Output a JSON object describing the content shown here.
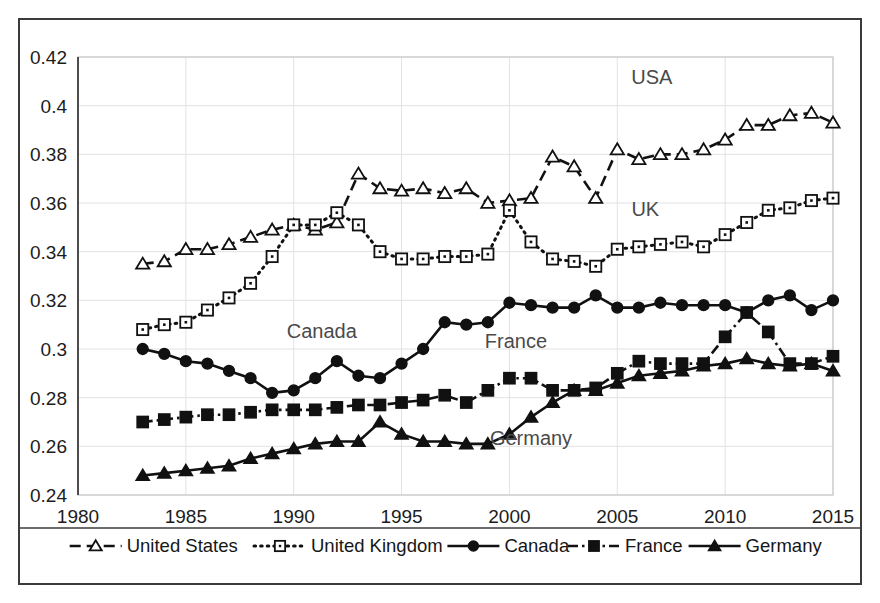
{
  "chart_data": {
    "type": "line",
    "title": "",
    "subtitle": "",
    "xlabel": "",
    "ylabel": "",
    "xlim": [
      1980,
      2015
    ],
    "ylim": [
      0.24,
      0.42
    ],
    "xticks": [
      1980,
      1985,
      1990,
      1995,
      2000,
      2005,
      2010,
      2015
    ],
    "xtick_labels": [
      "1980",
      "1985",
      "1990",
      "1995",
      "2000",
      "2005",
      "2010",
      "2015"
    ],
    "yticks": [
      0.24,
      0.26,
      0.28,
      0.3,
      0.32,
      0.34,
      0.36,
      0.38,
      0.4,
      0.42
    ],
    "ytick_labels": [
      "0.24",
      "0.26",
      "0.28",
      "0.3",
      "0.32",
      "0.34",
      "0.36",
      "0.38",
      "0.4",
      "0.42"
    ],
    "grid": true,
    "legend_position": "bottom",
    "x": [
      1983,
      1984,
      1985,
      1986,
      1987,
      1988,
      1989,
      1990,
      1991,
      1992,
      1993,
      1994,
      1995,
      1996,
      1997,
      1998,
      1999,
      2000,
      2001,
      2002,
      2003,
      2004,
      2005,
      2006,
      2007,
      2008,
      2009,
      2010,
      2011,
      2012,
      2013,
      2014,
      2015
    ],
    "series": [
      {
        "name": "United States",
        "annotation": "USA",
        "marker": "open-triangle",
        "line_style": "dashed",
        "color": "#111111",
        "values": [
          0.335,
          0.336,
          0.341,
          0.341,
          0.343,
          0.346,
          0.349,
          0.351,
          0.349,
          0.352,
          0.372,
          0.366,
          0.365,
          0.366,
          0.364,
          0.366,
          0.36,
          0.361,
          0.362,
          0.379,
          0.375,
          0.362,
          0.382,
          0.378,
          0.38,
          0.38,
          0.382,
          0.386,
          0.392,
          0.392,
          0.396,
          0.397,
          0.393
        ]
      },
      {
        "name": "United Kingdom",
        "annotation": "UK",
        "marker": "open-square",
        "line_style": "dotted",
        "color": "#111111",
        "values": [
          0.308,
          0.31,
          0.311,
          0.316,
          0.321,
          0.327,
          0.338,
          0.351,
          0.351,
          0.356,
          0.351,
          0.34,
          0.337,
          0.337,
          0.338,
          0.338,
          0.339,
          0.357,
          0.344,
          0.337,
          0.336,
          0.334,
          0.341,
          0.342,
          0.343,
          0.344,
          0.342,
          0.347,
          0.352,
          0.357,
          0.358,
          0.361,
          0.362
        ]
      },
      {
        "name": "Canada",
        "annotation": "Canada",
        "marker": "filled-circle",
        "line_style": "solid",
        "color": "#111111",
        "values": [
          0.3,
          0.298,
          0.295,
          0.294,
          0.291,
          0.288,
          0.282,
          0.283,
          0.288,
          0.295,
          0.289,
          0.288,
          0.294,
          0.3,
          0.311,
          0.31,
          0.311,
          0.319,
          0.318,
          0.317,
          0.317,
          0.322,
          0.317,
          0.317,
          0.319,
          0.318,
          0.318,
          0.318,
          0.315,
          0.32,
          0.322,
          0.316,
          0.32
        ]
      },
      {
        "name": "France",
        "annotation": "France",
        "marker": "filled-square",
        "line_style": "dash-dot",
        "color": "#111111",
        "values": [
          0.27,
          0.271,
          0.272,
          0.273,
          0.273,
          0.274,
          0.275,
          0.275,
          0.275,
          0.276,
          0.277,
          0.277,
          0.278,
          0.279,
          0.281,
          0.278,
          0.283,
          0.288,
          0.288,
          0.283,
          0.283,
          0.284,
          0.29,
          0.295,
          0.294,
          0.294,
          0.294,
          0.305,
          0.315,
          0.307,
          0.294,
          0.294,
          0.297
        ]
      },
      {
        "name": "Germany",
        "annotation": "Germany",
        "marker": "filled-triangle",
        "line_style": "solid",
        "color": "#111111",
        "values": [
          0.248,
          0.249,
          0.25,
          0.251,
          0.252,
          0.255,
          0.257,
          0.259,
          0.261,
          0.262,
          0.262,
          0.27,
          0.265,
          0.262,
          0.262,
          0.261,
          0.261,
          0.265,
          0.272,
          0.278,
          0.283,
          0.283,
          0.286,
          0.289,
          0.29,
          0.291,
          0.293,
          0.294,
          0.296,
          0.294,
          0.293,
          0.294,
          0.291
        ]
      }
    ],
    "annotations": [
      {
        "text": "USA",
        "x": 2006.6,
        "y": 0.409
      },
      {
        "text": "UK",
        "x": 2006.3,
        "y": 0.3545
      },
      {
        "text": "Canada",
        "x": 1991.3,
        "y": 0.3045
      },
      {
        "text": "France",
        "x": 2000.3,
        "y": 0.3005
      },
      {
        "text": "Germany",
        "x": 2001.0,
        "y": 0.2605
      }
    ],
    "legend": [
      {
        "label": "United States",
        "marker": "open-triangle",
        "line_style": "dashed"
      },
      {
        "label": "United Kingdom",
        "marker": "open-square",
        "line_style": "dotted"
      },
      {
        "label": "Canada",
        "marker": "filled-circle",
        "line_style": "solid"
      },
      {
        "label": "France",
        "marker": "filled-square",
        "line_style": "dash-dot"
      },
      {
        "label": "Germany",
        "marker": "filled-triangle",
        "line_style": "solid"
      }
    ]
  }
}
